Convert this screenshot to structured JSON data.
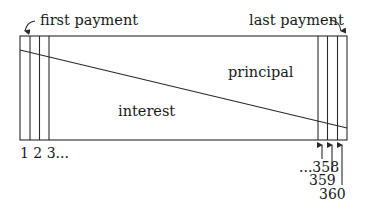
{
  "diagram": {
    "labels": {
      "first_payment": "first payment",
      "last_payment": "last payment",
      "principal": "principal",
      "interest": "interest",
      "first_ticks": "1 2 3...",
      "tick_358": "...358",
      "tick_359": "359",
      "tick_360": "360"
    },
    "colors": {
      "line": "#2a2a2a",
      "text": "#1a1a1a",
      "background": "#ffffff"
    },
    "payments": {
      "first": 1,
      "last": 360,
      "shown_left": [
        1,
        2,
        3
      ],
      "shown_right": [
        358,
        359,
        360
      ]
    }
  }
}
